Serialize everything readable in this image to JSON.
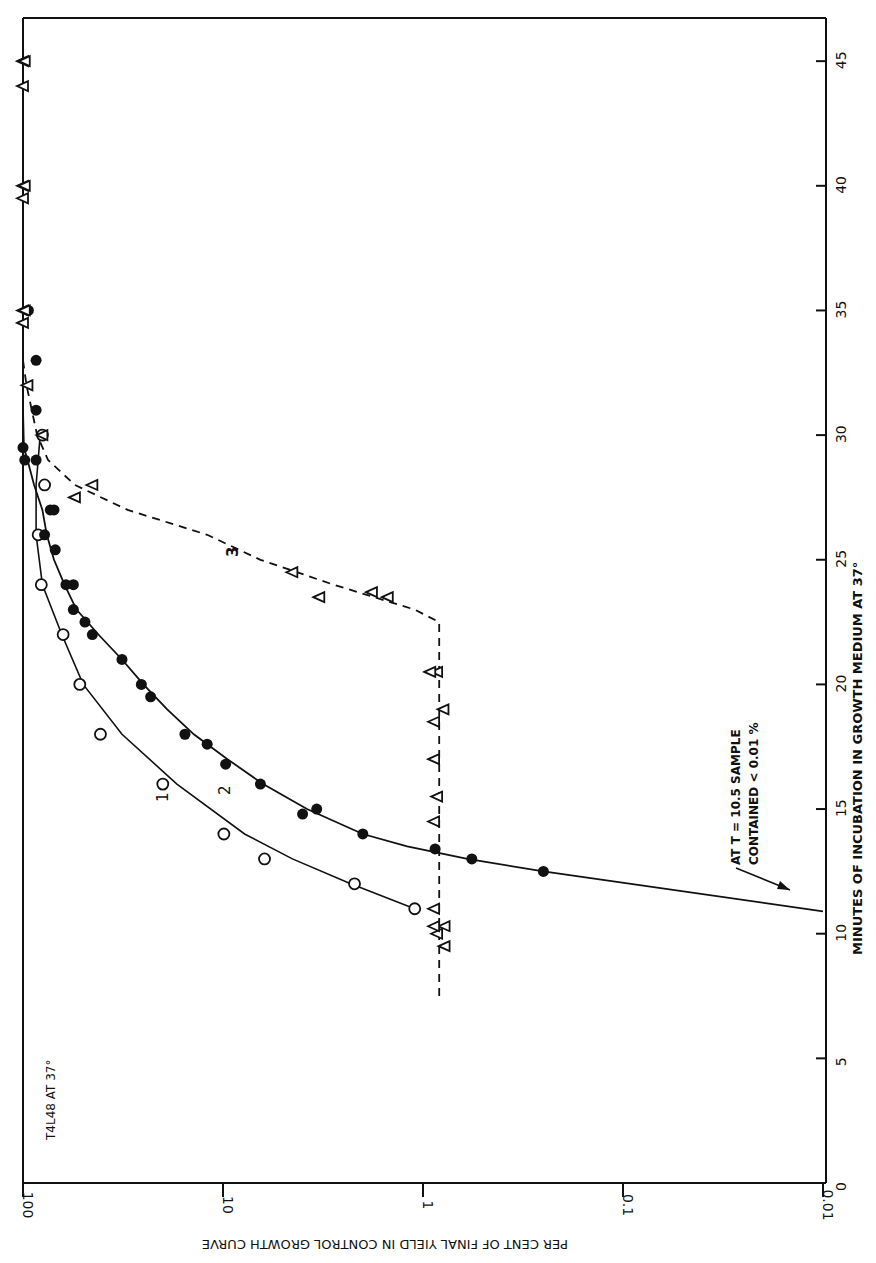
{
  "chart_data": {
    "type": "line",
    "orientation_note": "figure printed rotated 90 degrees clockwise",
    "title": "",
    "inset_label": "T4L48 AT 37°",
    "xlabel": "MINUTES OF INCUBATION IN GROWTH MEDIUM AT 37°",
    "ylabel": "PER CENT OF FINAL YIELD IN CONTROL GROWTH CURVE",
    "xlim": [
      0,
      46
    ],
    "ylim": [
      0.01,
      100
    ],
    "yscale": "log",
    "x_ticks": [
      "0",
      "5",
      "10",
      "15",
      "20",
      "25",
      "30",
      "35",
      "40",
      "45"
    ],
    "y_ticks": [
      "100",
      "10",
      "1",
      "0.1",
      "0.01"
    ],
    "y_tick_labels_display": [
      "100",
      "10",
      "1",
      "0.1",
      "0.01"
    ],
    "grid": false,
    "annotation": {
      "text_line1": "AT T = 10.5 SAMPLE",
      "text_line2": "CONTAINED < 0.01 %",
      "arrow_target": {
        "x": 11,
        "y": 0.015
      }
    },
    "series": [
      {
        "name": "1",
        "marker": "open-circle",
        "line": "solid",
        "x": [
          11,
          12,
          13,
          14,
          16,
          18,
          20,
          22,
          24,
          26,
          28,
          30
        ],
        "values": [
          1.1,
          2.2,
          6.2,
          9.9,
          20,
          41,
          52,
          63,
          81,
          84,
          78,
          80
        ]
      },
      {
        "name": "2",
        "marker": "filled-circle",
        "line": "solid",
        "x": [
          10.9,
          12.5,
          13,
          13.4,
          14,
          14.8,
          15,
          16,
          16.8,
          17.6,
          18,
          19.5,
          20,
          21,
          22,
          22.5,
          23,
          24,
          24,
          25.4,
          26,
          27,
          27,
          29,
          29,
          29.5,
          31,
          33,
          35
        ],
        "values": [
          0.01,
          0.25,
          0.57,
          0.87,
          2.0,
          4.0,
          3.4,
          6.5,
          9.7,
          12,
          15.5,
          23,
          25.6,
          32,
          45,
          49,
          56,
          56,
          61,
          69,
          78,
          73,
          70,
          86,
          98,
          100,
          86,
          86,
          94
        ]
      },
      {
        "name": "3",
        "marker": "open-triangle",
        "line": "dashed",
        "x": [
          9.5,
          10,
          10.3,
          10.3,
          11,
          14.5,
          15.5,
          17,
          19,
          18.5,
          20.5,
          20.5,
          23.5,
          23.7,
          23.5,
          24.5,
          27.5,
          28,
          30,
          32,
          34.5,
          35,
          35,
          39.5,
          40,
          40,
          44,
          45,
          45
        ],
        "values": [
          0.78,
          0.85,
          0.78,
          0.88,
          0.88,
          0.88,
          0.85,
          0.88,
          0.79,
          0.88,
          0.85,
          0.92,
          1.5,
          1.8,
          3.3,
          4.5,
          55,
          45,
          80,
          95,
          100,
          100,
          98,
          100,
          100,
          98,
          100,
          100,
          98
        ]
      }
    ]
  },
  "labels": {
    "inset": "T4L48 AT 37°",
    "xlabel": "MINUTES OF INCUBATION IN GROWTH MEDIUM AT 37°",
    "ylabel": "PER CENT OF FINAL YIELD IN CONTROL GROWTH CURVE",
    "annot1": "AT T = 10.5 SAMPLE",
    "annot2": "CONTAINED < 0.01 %",
    "curve1": "1",
    "curve2": "2",
    "curve3": "3"
  }
}
